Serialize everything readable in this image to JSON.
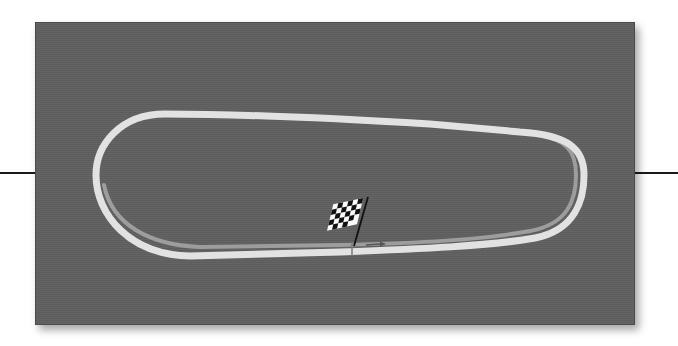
{
  "diagram": {
    "type": "race-track-map",
    "shape": "tri-oval",
    "background_color": "#5f5f5f",
    "track_color": "#e3e3e3",
    "apron_color": "#9a9a9a",
    "start_finish": {
      "marker": "checkered-flag-icon",
      "direction_arrow": "arrow-right-icon"
    }
  }
}
